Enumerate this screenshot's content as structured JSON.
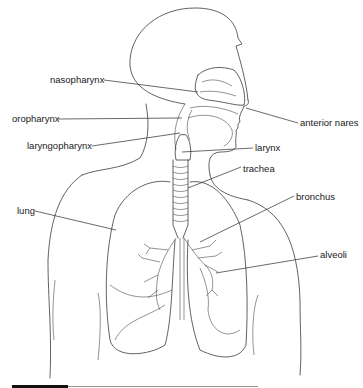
{
  "diagram": {
    "title": "",
    "type": "anatomical-labeled-diagram",
    "labels": [
      {
        "id": "nasopharynx",
        "text": "nasopharynx",
        "x": 50,
        "y": 20
      },
      {
        "id": "anterior-nares",
        "text": "anterior nares",
        "x": 300,
        "y": 122
      },
      {
        "id": "oropharynx",
        "text": "oropharynx",
        "x": 12,
        "y": 115
      },
      {
        "id": "laryngopharynx",
        "text": "laryngopharynx",
        "x": 27,
        "y": 142
      },
      {
        "id": "larynx",
        "text": "larynx",
        "x": 255,
        "y": 144
      },
      {
        "id": "trachea",
        "text": "trachea",
        "x": 243,
        "y": 163
      },
      {
        "id": "bronchus",
        "text": "bronchus",
        "x": 296,
        "y": 192
      },
      {
        "id": "lung",
        "text": "lung",
        "x": 17,
        "y": 207
      },
      {
        "id": "alveoli",
        "text": "alveoli",
        "x": 320,
        "y": 252
      }
    ],
    "colors": {
      "line": "#3a3a3a",
      "text": "#1a1a1a",
      "background": "#ffffff",
      "bar_dark": "#111111",
      "bar_light": "#999999"
    }
  }
}
